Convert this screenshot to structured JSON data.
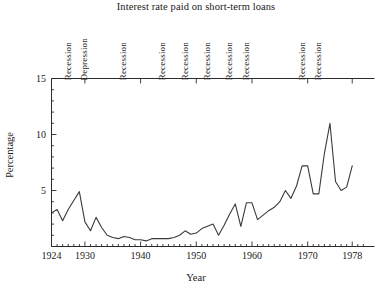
{
  "chart_data": {
    "type": "line",
    "title": "Interest rate paid on short-term loans",
    "xlabel": "Year",
    "ylabel": "Percentage",
    "xlim": [
      1924,
      1982
    ],
    "ylim": [
      0,
      15
    ],
    "xticks": [
      1924,
      1930,
      1940,
      1950,
      1960,
      1970,
      1978
    ],
    "xtick_labels": [
      "1924",
      "1930",
      "1940",
      "1950",
      "1960",
      "1970",
      "1978"
    ],
    "yticks": [
      5,
      10,
      15
    ],
    "ytick_labels": [
      "5",
      "10",
      "15"
    ],
    "minor_ticks": true,
    "grid": false,
    "legend": "none",
    "x": [
      1924,
      1925,
      1926,
      1927,
      1928,
      1929,
      1930,
      1931,
      1932,
      1933,
      1934,
      1935,
      1936,
      1937,
      1938,
      1939,
      1940,
      1941,
      1942,
      1943,
      1944,
      1945,
      1946,
      1947,
      1948,
      1949,
      1950,
      1951,
      1952,
      1953,
      1954,
      1955,
      1956,
      1957,
      1958,
      1959,
      1960,
      1961,
      1962,
      1963,
      1964,
      1965,
      1966,
      1967,
      1968,
      1969,
      1970,
      1971,
      1972,
      1973,
      1974,
      1975,
      1976,
      1977,
      1978
    ],
    "values": [
      3.0,
      3.3,
      2.3,
      3.3,
      4.1,
      4.9,
      2.2,
      1.4,
      2.6,
      1.7,
      1.0,
      0.8,
      0.7,
      0.9,
      0.8,
      0.6,
      0.6,
      0.5,
      0.7,
      0.7,
      0.7,
      0.7,
      0.8,
      1.0,
      1.4,
      1.1,
      1.2,
      1.6,
      1.8,
      2.0,
      1.0,
      1.9,
      2.9,
      3.8,
      1.8,
      3.9,
      3.9,
      2.4,
      2.8,
      3.2,
      3.5,
      4.0,
      5.0,
      4.3,
      5.4,
      7.2,
      7.2,
      4.7,
      4.7,
      8.3,
      11.0,
      5.8,
      5.0,
      5.3,
      7.2
    ],
    "annotations": [
      {
        "label": "Recession",
        "year": 1927
      },
      {
        "label": "Depression",
        "year": 1930
      },
      {
        "label": "Recession",
        "year": 1937
      },
      {
        "label": "Recession",
        "year": 1944
      },
      {
        "label": "Recession",
        "year": 1948
      },
      {
        "label": "Recession",
        "year": 1952
      },
      {
        "label": "Recession",
        "year": 1956
      },
      {
        "label": "Recession",
        "year": 1959
      },
      {
        "label": "Recession",
        "year": 1969
      },
      {
        "label": "Recession",
        "year": 1972
      }
    ]
  }
}
